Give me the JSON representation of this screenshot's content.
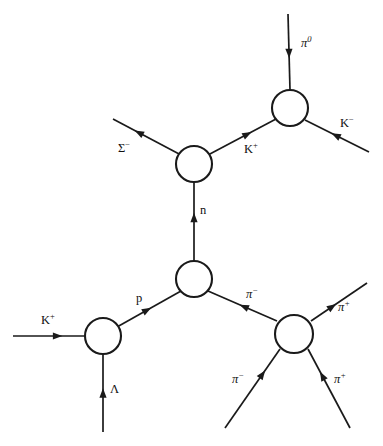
{
  "figure": {
    "kind": "bubble-chamber-interaction-diagram",
    "background_color": "#ffffff",
    "ink_color": "#1a1a1a",
    "width": 383,
    "height": 446
  },
  "chart_data": {
    "type": "diagram",
    "title": "",
    "vertices": [
      {
        "id": "v-pi0-kminus",
        "name": "pi-zero-k-minus-vertex",
        "cx": 290,
        "cy": 108,
        "r": 18,
        "prongs": 3
      },
      {
        "id": "v-sigma",
        "name": "sigma-minus-vertex",
        "cx": 194,
        "cy": 164,
        "r": 18,
        "prongs": 3
      },
      {
        "id": "v-central",
        "name": "central-vertex",
        "cx": 194,
        "cy": 279,
        "r": 18,
        "prongs": 3
      },
      {
        "id": "v-kplus-lambda",
        "name": "k-plus-lambda-vertex",
        "cx": 103,
        "cy": 336,
        "r": 18,
        "prongs": 3
      },
      {
        "id": "v-four-prong",
        "name": "four-prong-pion-vertex",
        "cx": 294,
        "cy": 334,
        "r": 19,
        "prongs": 4
      }
    ],
    "tracks": [
      {
        "id": "t-pi0",
        "particle": "pi0",
        "label_text": "π",
        "label_sup": "0",
        "label_style": "greek",
        "label_x": 301,
        "label_y": 35,
        "x1": 288,
        "y1": 14,
        "x2": 290,
        "y2": 90,
        "arrow_at": 0.52,
        "arrow_dir": "up"
      },
      {
        "id": "t-kminus",
        "particle": "K-",
        "label_text": "K",
        "label_sup": "−",
        "label_style": "roman",
        "label_x": 340,
        "label_y": 115,
        "x1": 369,
        "y1": 152,
        "x2": 305,
        "y2": 120,
        "arrow_at": 0.52,
        "arrow_dir": "toward-vertex"
      },
      {
        "id": "t-kplus-upper",
        "particle": "K+",
        "label_text": "K",
        "label_sup": "+",
        "label_style": "roman",
        "label_x": 244,
        "label_y": 141,
        "x1": 208,
        "y1": 155,
        "x2": 276,
        "y2": 119,
        "arrow_at": 0.58,
        "arrow_dir": "up-right"
      },
      {
        "id": "t-sigma-minus",
        "particle": "Sigma-",
        "label_text": "Σ",
        "label_sup": "−",
        "label_style": "roman",
        "label_x": 118,
        "label_y": 140,
        "x1": 181,
        "y1": 155,
        "x2": 113,
        "y2": 119,
        "arrow_at": 0.62,
        "arrow_dir": "up-left"
      },
      {
        "id": "t-neutron",
        "particle": "n",
        "label_text": "n",
        "label_sup": "",
        "label_style": "roman",
        "label_x": 200,
        "label_y": 204,
        "x1": 194,
        "y1": 261,
        "x2": 194,
        "y2": 182,
        "arrow_at": 0.55,
        "arrow_dir": "up"
      },
      {
        "id": "t-proton",
        "particle": "p",
        "label_text": "p",
        "label_sup": "",
        "label_style": "roman",
        "label_x": 136,
        "label_y": 292,
        "x1": 117,
        "y1": 327,
        "x2": 181,
        "y2": 291,
        "arrow_at": 0.47,
        "arrow_dir": "up-right"
      },
      {
        "id": "t-kplus-beam",
        "particle": "K+",
        "label_text": "K",
        "label_sup": "+",
        "label_style": "roman",
        "label_x": 41,
        "label_y": 312,
        "x1": 13,
        "y1": 336,
        "x2": 85,
        "y2": 336,
        "arrow_at": 0.62,
        "arrow_dir": "right"
      },
      {
        "id": "t-lambda",
        "particle": "Lambda",
        "label_text": "Λ",
        "label_sup": "",
        "label_style": "roman",
        "label_x": 110,
        "label_y": 383,
        "x1": 103,
        "y1": 432,
        "x2": 103,
        "y2": 354,
        "arrow_at": 0.5,
        "arrow_dir": "up"
      },
      {
        "id": "t-piminus-central",
        "particle": "pi-",
        "label_text": "π",
        "label_sup": "−",
        "label_style": "greek",
        "label_x": 246,
        "label_y": 286,
        "x1": 277,
        "y1": 321,
        "x2": 208,
        "y2": 291,
        "arrow_at": 0.48,
        "arrow_dir": "up-left"
      },
      {
        "id": "t-piplus-upper-right",
        "particle": "pi+",
        "label_text": "π",
        "label_sup": "+",
        "label_style": "greek",
        "label_x": 338,
        "label_y": 299,
        "x1": 311,
        "y1": 321,
        "x2": 367,
        "y2": 283,
        "arrow_at": 0.38,
        "arrow_dir": "up-right"
      },
      {
        "id": "t-piminus-lower-left",
        "particle": "pi-",
        "label_text": "π",
        "label_sup": "−",
        "label_style": "greek",
        "label_x": 232,
        "label_y": 371,
        "x1": 225,
        "y1": 428,
        "x2": 280,
        "y2": 349,
        "arrow_at": 0.68,
        "arrow_dir": "up-right"
      },
      {
        "id": "t-piplus-lower-right",
        "particle": "pi+",
        "label_text": "π",
        "label_sup": "+",
        "label_style": "greek",
        "label_x": 334,
        "label_y": 371,
        "x1": 350,
        "y1": 428,
        "x2": 308,
        "y2": 349,
        "arrow_at": 0.66,
        "arrow_dir": "up-left"
      }
    ]
  }
}
